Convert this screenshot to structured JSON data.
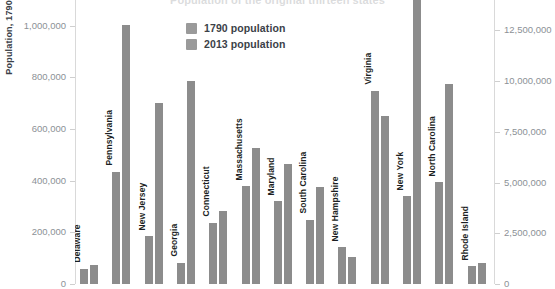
{
  "chart_data": {
    "type": "bar",
    "title": "Population of the original thirteen states",
    "categories": [
      "Delaware",
      "Pennsylvania",
      "New Jersey",
      "Georgia",
      "Connecticut",
      "Massachusetts",
      "Maryland",
      "South Carolina",
      "New Hampshire",
      "Virginia",
      "New York",
      "North Carolina",
      "Rhode Island"
    ],
    "series": [
      {
        "name": "1790 population",
        "axis": "left",
        "values": [
          59094,
          434373,
          184139,
          82548,
          237946,
          378787,
          319728,
          249073,
          141885,
          747610,
          340120,
          393751,
          68825
        ]
      },
      {
        "name": "2013 population",
        "axis": "right",
        "values": [
          925749,
          12773801,
          8899339,
          9992167,
          3596080,
          6692824,
          5928814,
          4774839,
          1323459,
          8260405,
          19651127,
          9848060,
          1051511
        ]
      }
    ],
    "ylabel": "Population, 1790",
    "ylabel_right": "",
    "xlabel": "",
    "ylim": [
      0,
      1100000
    ],
    "ylim_right": [
      0,
      14000000
    ],
    "left_ticks": [
      "0",
      "200,000",
      "400,000",
      "600,000",
      "800,000",
      "1,000,000"
    ],
    "left_tick_values": [
      0,
      200000,
      400000,
      600000,
      800000,
      1000000
    ],
    "right_ticks": [
      "0",
      "2,500,000",
      "5,000,000",
      "7,500,000",
      "10,000,000",
      "12,500,000"
    ],
    "right_tick_values": [
      0,
      2500000,
      5000000,
      7500000,
      10000000,
      12500000
    ],
    "grid": false,
    "legend_position": "upper-center",
    "bar_color": "#8c8c8c",
    "note": "view is cropped: chart title and x-axis baseline are clipped; tall 2013 bars extend above the top edge"
  },
  "legend": {
    "items": [
      {
        "label": "1790 population"
      },
      {
        "label": "2013 population"
      }
    ]
  },
  "axes": {
    "left_title": "Population, 1790"
  },
  "colors": {
    "bar": "#8c8c8c",
    "legend_swatch": "#9a9a9a",
    "tick_label": "#8c9196",
    "axis_line": "#d9d9d9",
    "category_label": "#1c1f23"
  }
}
